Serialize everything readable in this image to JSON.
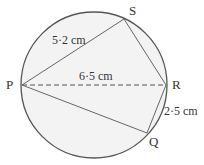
{
  "diagram": {
    "points": {
      "P": "P",
      "Q": "Q",
      "R": "R",
      "S": "S"
    },
    "measurements": {
      "PS": "5·2 cm",
      "PR": "6·5 cm",
      "RQ": "2·5 cm"
    },
    "colors": {
      "fill": "#f2f2f2",
      "stroke": "#555555"
    }
  }
}
